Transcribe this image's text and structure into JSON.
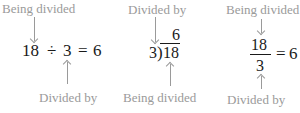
{
  "panels": [
    {
      "name": "inline",
      "top_label": "Being divided",
      "bottom_label": "Divided by",
      "expression": {
        "dividend": "18",
        "operator": "÷",
        "divisor": "3",
        "equals": "=",
        "quotient": "6"
      }
    },
    {
      "name": "long-division",
      "top_label": "Divided by",
      "bottom_label": "Being divided",
      "expression": {
        "divisor": "3",
        "bracket": ")",
        "dividend": "18",
        "quotient": "6"
      }
    },
    {
      "name": "fraction",
      "top_label": "Being divided",
      "bottom_label": "Divided by",
      "expression": {
        "numerator": "18",
        "denominator": "3",
        "equals": "=",
        "result": "6"
      }
    }
  ],
  "colors": {
    "label": "#9a9a9a",
    "math": "#1a1a1a"
  }
}
